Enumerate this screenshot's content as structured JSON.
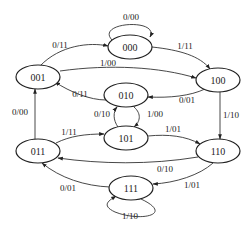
{
  "diagram": {
    "type": "state-transition-diagram",
    "nodes": [
      {
        "id": "000",
        "label": "000",
        "x": 130,
        "y": 47
      },
      {
        "id": "001",
        "label": "001",
        "x": 38,
        "y": 77
      },
      {
        "id": "100",
        "label": "100",
        "x": 218,
        "y": 80
      },
      {
        "id": "010",
        "label": "010",
        "x": 126,
        "y": 95
      },
      {
        "id": "101",
        "label": "101",
        "x": 126,
        "y": 138
      },
      {
        "id": "011",
        "label": "011",
        "x": 38,
        "y": 151
      },
      {
        "id": "110",
        "label": "110",
        "x": 218,
        "y": 151
      },
      {
        "id": "111",
        "label": "111",
        "x": 131,
        "y": 188
      }
    ],
    "edges": [
      {
        "from": "000",
        "to": "000",
        "label": "0/00"
      },
      {
        "from": "001",
        "to": "000",
        "label": "0/11"
      },
      {
        "from": "000",
        "to": "100",
        "label": "1/11"
      },
      {
        "from": "001",
        "to": "100",
        "label": "1/00"
      },
      {
        "from": "010",
        "to": "001",
        "label": "0/11"
      },
      {
        "from": "100",
        "to": "010",
        "label": "0/01"
      },
      {
        "from": "010",
        "to": "101",
        "label": "1/00"
      },
      {
        "from": "101",
        "to": "010",
        "label": "0/10"
      },
      {
        "from": "011",
        "to": "001",
        "label": "0/00"
      },
      {
        "from": "100",
        "to": "110",
        "label": "1/10"
      },
      {
        "from": "011",
        "to": "101",
        "label": "1/11"
      },
      {
        "from": "101",
        "to": "110",
        "label": "1/01"
      },
      {
        "from": "110",
        "to": "011",
        "label": "0/10"
      },
      {
        "from": "110",
        "to": "111",
        "label": "1/01"
      },
      {
        "from": "111",
        "to": "011",
        "label": "0/01"
      },
      {
        "from": "111",
        "to": "111",
        "label": "1/10"
      }
    ]
  },
  "labels": {
    "n000": "000",
    "n001": "001",
    "n100": "100",
    "n010": "010",
    "n101": "101",
    "n011": "011",
    "n110": "110",
    "n111": "111",
    "e_000_000": "0/00",
    "e_001_000": "0/11",
    "e_000_100": "1/11",
    "e_001_100": "1/00",
    "e_010_001": "0/11",
    "e_100_010": "0/01",
    "e_010_101": "1/00",
    "e_101_010": "0/10",
    "e_011_001": "0/00",
    "e_100_110": "1/10",
    "e_011_101": "1/11",
    "e_101_110": "1/01",
    "e_110_011": "0/10",
    "e_110_111": "1/01",
    "e_111_011": "0/01",
    "e_111_111": "1/10"
  }
}
